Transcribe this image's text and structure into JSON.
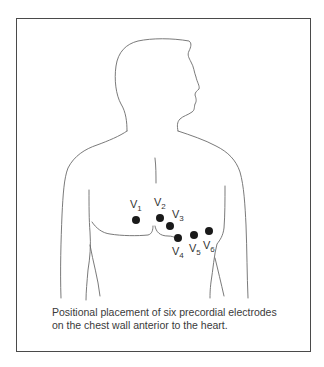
{
  "figure": {
    "caption": {
      "line1": "Positional placement of six precordial electrodes",
      "line2": "on the chest wall anterior to the heart."
    },
    "electrodes": [
      {
        "label": "V",
        "sub": "1"
      },
      {
        "label": "V",
        "sub": "2"
      },
      {
        "label": "V",
        "sub": "3"
      },
      {
        "label": "V",
        "sub": "4"
      },
      {
        "label": "V",
        "sub": "5"
      },
      {
        "label": "V",
        "sub": "6"
      }
    ],
    "colors": {
      "border": "#4a4a4a",
      "outline": "#6b6b6b",
      "electrode": "#1a1a1a",
      "text": "#333333"
    }
  }
}
